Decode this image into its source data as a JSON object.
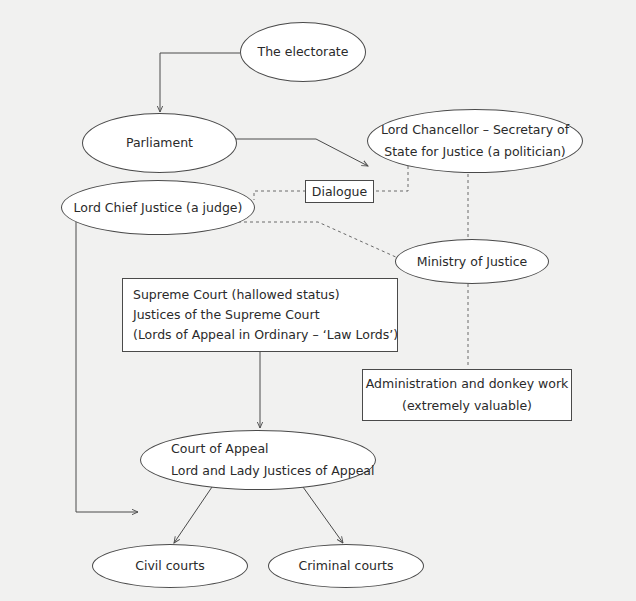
{
  "diagram": {
    "title": "",
    "nodes": {
      "electorate": {
        "lines": [
          "The electorate"
        ],
        "shape": "ellipse"
      },
      "parliament": {
        "lines": [
          "Parliament"
        ],
        "shape": "ellipse"
      },
      "lord_chancellor": {
        "lines": [
          "Lord Chancellor – Secretary of",
          "State for Justice (a politician)"
        ],
        "shape": "ellipse"
      },
      "dialogue": {
        "lines": [
          "Dialogue"
        ],
        "shape": "rect"
      },
      "lord_chief_justice": {
        "lines": [
          "Lord Chief Justice (a judge)"
        ],
        "shape": "ellipse"
      },
      "ministry_of_justice": {
        "lines": [
          "Ministry of Justice"
        ],
        "shape": "ellipse"
      },
      "supreme_court": {
        "lines": [
          "Supreme Court (hallowed status)",
          "Justices of the Supreme Court",
          "(Lords of Appeal in Ordinary – ‘Law Lords’)"
        ],
        "shape": "rect"
      },
      "administration": {
        "lines": [
          "Administration and donkey work",
          "(extremely valuable)"
        ],
        "shape": "rect"
      },
      "court_of_appeal": {
        "lines": [
          "Court of Appeal",
          "Lord and Lady Justices of Appeal"
        ],
        "shape": "ellipse"
      },
      "civil_courts": {
        "lines": [
          "Civil courts"
        ],
        "shape": "ellipse"
      },
      "criminal_courts": {
        "lines": [
          "Criminal courts"
        ],
        "shape": "ellipse"
      }
    },
    "edges": [
      {
        "from": "electorate",
        "to": "parliament",
        "style": "solid-arrow"
      },
      {
        "from": "parliament",
        "to": "lord_chancellor",
        "style": "solid-arrow"
      },
      {
        "from": "lord_chancellor",
        "to": "dialogue",
        "style": "dashed"
      },
      {
        "from": "dialogue",
        "to": "lord_chief_justice",
        "style": "dashed"
      },
      {
        "from": "lord_chancellor",
        "to": "ministry_of_justice",
        "style": "dashed"
      },
      {
        "from": "lord_chief_justice",
        "to": "ministry_of_justice",
        "style": "dashed"
      },
      {
        "from": "ministry_of_justice",
        "to": "administration",
        "style": "dashed"
      },
      {
        "from": "lord_chief_justice",
        "to": "court_of_appeal",
        "style": "solid-arrow"
      },
      {
        "from": "supreme_court",
        "to": "court_of_appeal",
        "style": "solid-arrow"
      },
      {
        "from": "court_of_appeal",
        "to": "civil_courts",
        "style": "solid-arrow"
      },
      {
        "from": "court_of_appeal",
        "to": "criminal_courts",
        "style": "solid-arrow"
      }
    ],
    "colors": {
      "background": "#f1f1f0",
      "node_fill": "#ffffff",
      "stroke": "#4a4a4a"
    }
  }
}
